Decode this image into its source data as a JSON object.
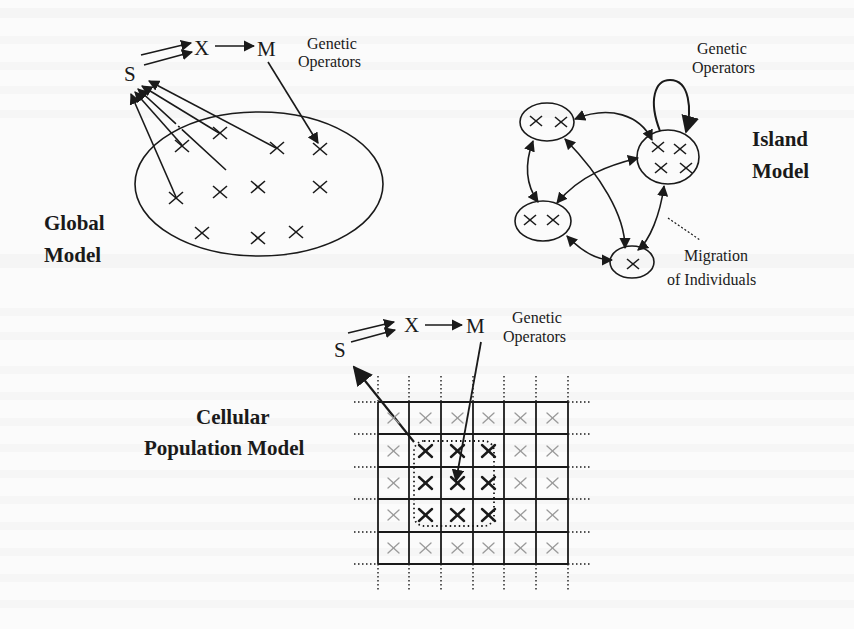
{
  "figure": {
    "background_color": "#fbfbfb",
    "ink_color": "#1a1a1a",
    "panels": {
      "global": {
        "title_line1": "Global",
        "title_line2": "Model",
        "op_s": "S",
        "op_x": "X",
        "op_m": "M",
        "ops_label_line1": "Genetic",
        "ops_label_line2": "Operators",
        "individual_glyph": "×",
        "individual_count": 11
      },
      "island": {
        "title_line1": "Island",
        "title_line2": "Model",
        "ops_label_line1": "Genetic",
        "ops_label_line2": "Operators",
        "migration_label_line1": "Migration",
        "migration_label_line2": "of Individuals",
        "individual_glyph": "×",
        "islands": [
          {
            "name": "island-top-left",
            "individuals": 2
          },
          {
            "name": "island-right",
            "individuals": 4
          },
          {
            "name": "island-left",
            "individuals": 2
          },
          {
            "name": "island-bottom",
            "individuals": 1
          }
        ]
      },
      "cellular": {
        "title_line1": "Cellular",
        "title_line2": "Population Model",
        "op_s": "S",
        "op_x": "X",
        "op_m": "M",
        "ops_label_line1": "Genetic",
        "ops_label_line2": "Operators",
        "grid_rows": 5,
        "grid_cols": 6,
        "individual_glyph": "×",
        "neighborhood": "3×3 dotted region"
      }
    }
  }
}
